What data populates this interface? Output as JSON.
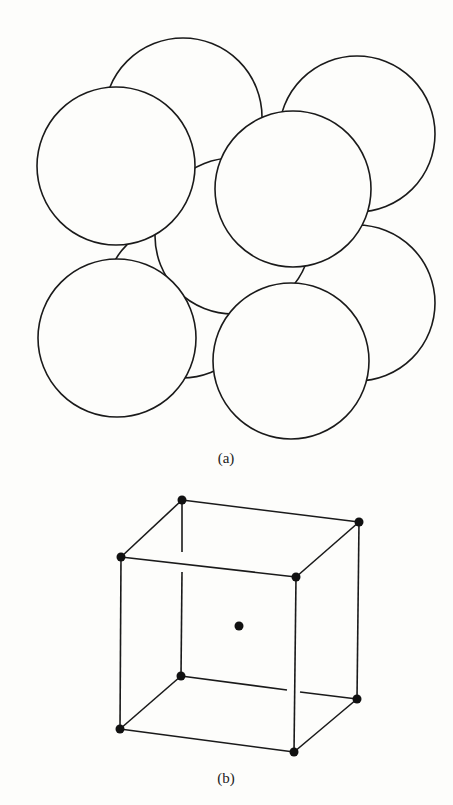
{
  "figure": {
    "part_a": {
      "label": "(a)",
      "description": "Hard-sphere model of body-centered cubic unit cell",
      "atoms": [
        {
          "id": "back-top-left",
          "cx": 183,
          "cy": 117,
          "r": 79
        },
        {
          "id": "back-top-right",
          "cx": 357,
          "cy": 134,
          "r": 78
        },
        {
          "id": "back-bottom-left",
          "cx": 182,
          "cy": 300,
          "r": 78
        },
        {
          "id": "back-bottom-right",
          "cx": 357,
          "cy": 303,
          "r": 78
        },
        {
          "id": "center",
          "cx": 233,
          "cy": 236,
          "r": 78
        },
        {
          "id": "front-top-left",
          "cx": 116,
          "cy": 166,
          "r": 79
        },
        {
          "id": "front-top-right",
          "cx": 293,
          "cy": 189,
          "r": 78
        },
        {
          "id": "front-bottom-left",
          "cx": 117,
          "cy": 338,
          "r": 79
        },
        {
          "id": "front-bottom-right",
          "cx": 291,
          "cy": 361,
          "r": 78
        }
      ]
    },
    "part_b": {
      "label": "(b)",
      "description": "Reduced-sphere BCC unit cell lattice points",
      "vertices": {
        "btl": [
          182,
          500
        ],
        "btr": [
          359,
          522
        ],
        "ftl": [
          121,
          557
        ],
        "ftr": [
          296,
          577
        ],
        "bbl": [
          181,
          676
        ],
        "bbr": [
          357,
          699
        ],
        "fbl": [
          120,
          729
        ],
        "fbr": [
          294,
          752
        ],
        "center": [
          239,
          626
        ]
      }
    }
  }
}
